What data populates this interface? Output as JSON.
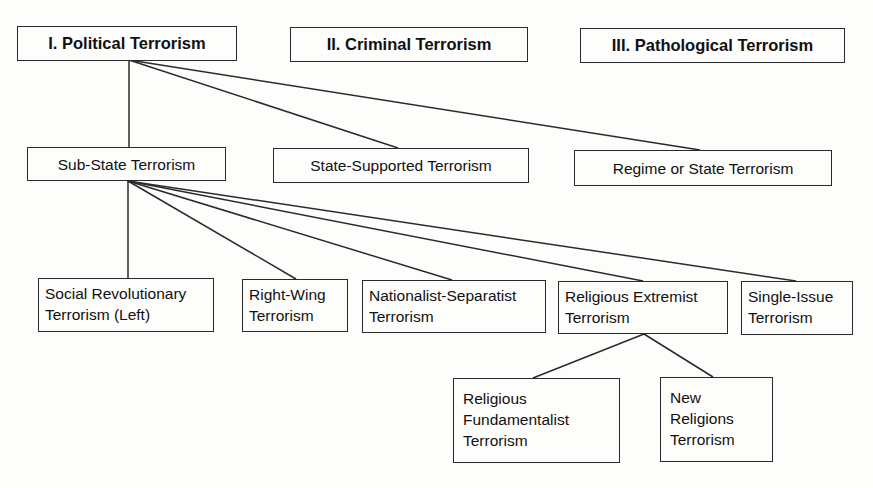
{
  "diagram": {
    "top_level": [
      {
        "id": "political",
        "label": "I. Political Terrorism"
      },
      {
        "id": "criminal",
        "label": "II. Criminal Terrorism"
      },
      {
        "id": "pathological",
        "label": "III. Pathological Terrorism"
      }
    ],
    "political_types": [
      {
        "id": "substate",
        "label": "Sub-State Terrorism"
      },
      {
        "id": "statesupported",
        "label": "State-Supported Terrorism"
      },
      {
        "id": "regime",
        "label": "Regime or State Terrorism"
      }
    ],
    "substate_types": [
      {
        "id": "socialrev",
        "label": "Social Revolutionary\nTerrorism (Left)"
      },
      {
        "id": "rightwing",
        "label": "Right-Wing\nTerrorism"
      },
      {
        "id": "nationalist",
        "label": "Nationalist-Separatist\nTerrorism"
      },
      {
        "id": "religious",
        "label": "Religious Extremist\nTerrorism"
      },
      {
        "id": "singleissue",
        "label": "Single-Issue\nTerrorism"
      }
    ],
    "religious_types": [
      {
        "id": "fundamentalist",
        "label": "Religious\nFundamentalist\nTerrorism"
      },
      {
        "id": "newreligions",
        "label": "New\nReligions\nTerrorism"
      }
    ],
    "edges": [
      [
        "political",
        "substate"
      ],
      [
        "political",
        "statesupported"
      ],
      [
        "political",
        "regime"
      ],
      [
        "substate",
        "socialrev"
      ],
      [
        "substate",
        "rightwing"
      ],
      [
        "substate",
        "nationalist"
      ],
      [
        "substate",
        "religious"
      ],
      [
        "substate",
        "singleissue"
      ],
      [
        "religious",
        "fundamentalist"
      ],
      [
        "religious",
        "newreligions"
      ]
    ]
  }
}
